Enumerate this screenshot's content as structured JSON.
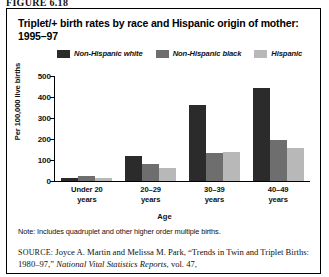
{
  "figure": {
    "number": "FIGURE 6.18"
  },
  "chart_data": {
    "type": "bar",
    "title": "Triplet/+ birth rates by race and Hispanic origin of mother: 1995–97",
    "xlabel": "Age",
    "ylabel": "Per 100,000 live births",
    "categories": [
      "Under 20 years",
      "20–29 years",
      "30–39 years",
      "40–49 years"
    ],
    "category_lines": [
      [
        "Under 20",
        "years"
      ],
      [
        "20–29",
        "years"
      ],
      [
        "30–39",
        "years"
      ],
      [
        "40–49",
        "years"
      ]
    ],
    "series": [
      {
        "name": "Non-Hispanic white",
        "color": "#2b2b2b",
        "values": [
          12,
          120,
          360,
          442
        ]
      },
      {
        "name": "Non-Hispanic black",
        "color": "#6e6e6e",
        "values": [
          22,
          82,
          135,
          195
        ]
      },
      {
        "name": "Hispanic",
        "color": "#b8b8b8",
        "values": [
          14,
          62,
          140,
          155
        ]
      }
    ],
    "ylim": [
      0,
      500
    ],
    "yticks": [
      0,
      100,
      200,
      300,
      400,
      500
    ],
    "ytick_labels": [
      "0",
      "100",
      "200",
      "300",
      "400",
      "500"
    ],
    "grid": false,
    "legend_position": "top"
  },
  "note": {
    "text": "Note: Includes quadruplet and other higher order multiple births."
  },
  "source": {
    "label": "SOURCE:",
    "part1": " Joyce A. Martin and Melissa M. Park, “Trends in Twin and Triplet Births: 1980–97,” ",
    "italic": "National Vital Statistics Reports",
    "part2": ", vol. 47,"
  }
}
